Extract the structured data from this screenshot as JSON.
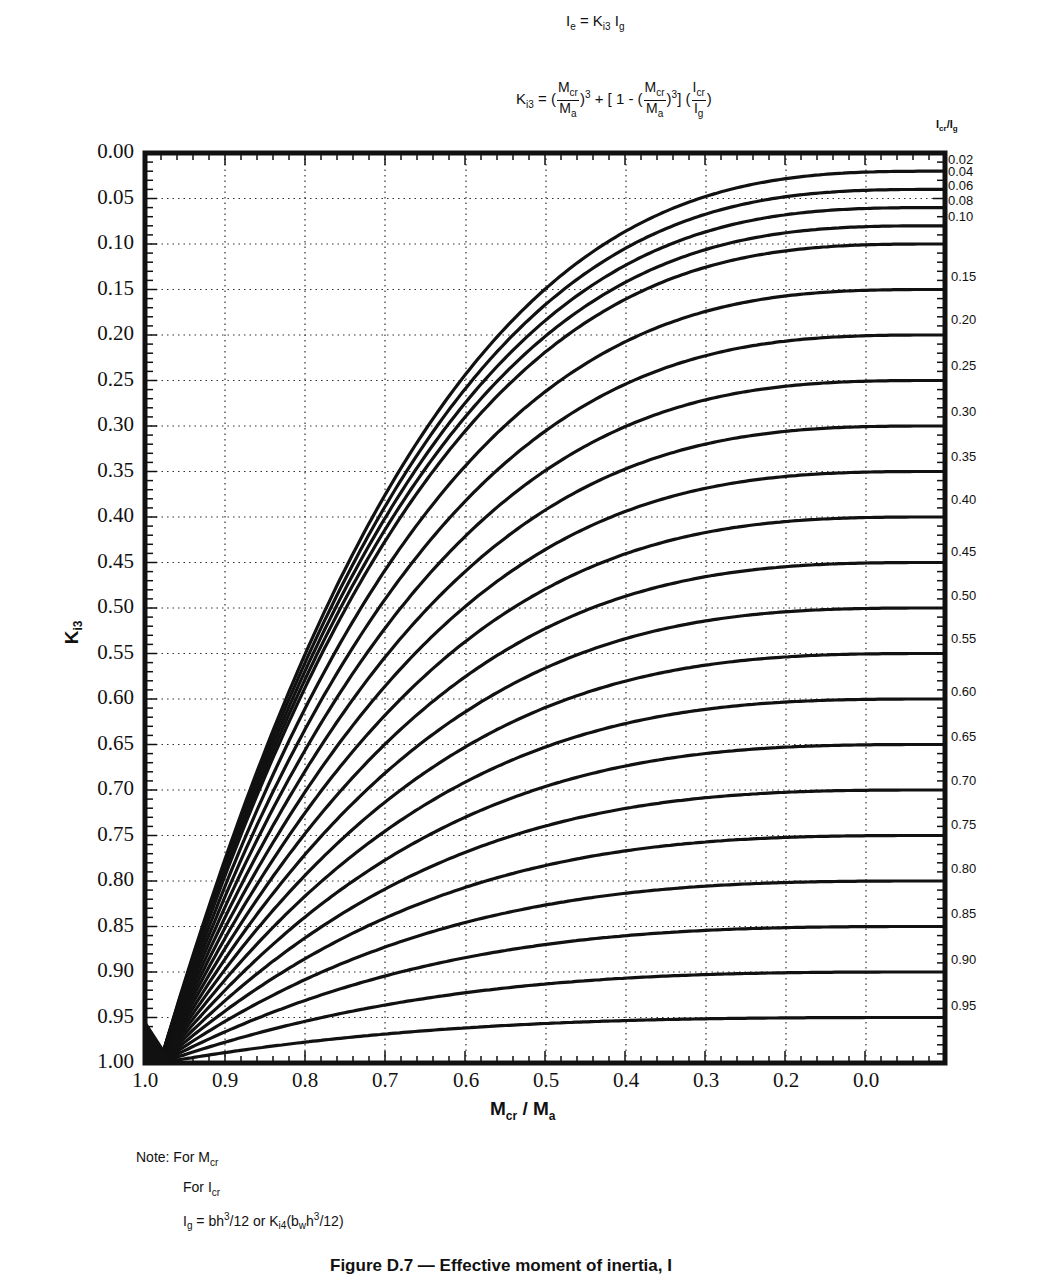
{
  "header": {
    "eq1": {
      "lhs": "I",
      "lhs_sub": "e",
      "eq": " = K",
      "k_sub": "i3",
      "rhs": " I",
      "rhs_sub": "g"
    },
    "eq2": {
      "k": "K",
      "k_sub": "i3",
      "eq": " = (",
      "frac1_num": "M",
      "frac1_num_sub": "cr",
      "frac1_den": "M",
      "frac1_den_sub": "a",
      "pow1": "3",
      "mid": " + [ 1 - (",
      "frac2_num": "M",
      "frac2_num_sub": "cr",
      "frac2_den": "M",
      "frac2_den_sub": "a",
      "pow2": "3",
      "mid2": "] (",
      "frac3_num": "I",
      "frac3_num_sub": "cr",
      "frac3_den": "I",
      "frac3_den_sub": "g",
      "close": ")"
    }
  },
  "right_axis_title": {
    "a": "I",
    "a_sub": "cr",
    "slash": "/",
    "b": "I",
    "b_sub": "g"
  },
  "y_axis_title": {
    "main": "K",
    "sub": "i3"
  },
  "x_axis_title": {
    "a": "M",
    "a_sub": "cr",
    "slash": " / ",
    "b": "M",
    "b_sub": "a"
  },
  "note": {
    "line1": "Note: For M",
    "line1_sub": "cr",
    "line2": "For I",
    "line2_sub": "cr",
    "line3_a": "I",
    "line3_a_sub": "g",
    "line3_b": " = bh",
    "line3_b_sup": "3",
    "line3_c": "/12 or K",
    "line3_c_sub": "i4",
    "line3_d": "(b",
    "line3_d_sub": "w",
    "line3_e": "h",
    "line3_e_sup": "3",
    "line3_f": "/12)"
  },
  "caption": "Figure D.7 — Effective moment of inertia, I",
  "chart_data": {
    "type": "line",
    "xlabel": "Mcr / Ma",
    "ylabel": "Ki3",
    "x_tick_labels": [
      "1.0",
      "0.9",
      "0.8",
      "0.7",
      "0.6",
      "0.5",
      "0.4",
      "0.3",
      "0.2",
      "0.0"
    ],
    "y_tick_labels": [
      "0.00",
      "0.05",
      "0.10",
      "0.15",
      "0.20",
      "0.25",
      "0.30",
      "0.35",
      "0.40",
      "0.45",
      "0.50",
      "0.55",
      "0.60",
      "0.65",
      "0.70",
      "0.75",
      "0.80",
      "0.85",
      "0.90",
      "0.95",
      "1.00"
    ],
    "ylim": [
      1.0,
      0.0
    ],
    "y_inverted": true,
    "xlim": [
      1.0,
      0.0
    ],
    "grid": "dotted",
    "legend_position": "right (curve labels Icr/Ig)",
    "series_labels": [
      "0.02",
      "0.04",
      "0.06",
      "0.08",
      "0.10",
      "0.15",
      "0.20",
      "0.25",
      "0.30",
      "0.35",
      "0.40",
      "0.45",
      "0.50",
      "0.55",
      "0.60",
      "0.65",
      "0.70",
      "0.75",
      "0.80",
      "0.85",
      "0.90",
      "0.95"
    ],
    "series_values": [
      0.02,
      0.04,
      0.06,
      0.08,
      0.1,
      0.15,
      0.2,
      0.25,
      0.3,
      0.35,
      0.4,
      0.45,
      0.5,
      0.55,
      0.6,
      0.65,
      0.7,
      0.75,
      0.8,
      0.85,
      0.9,
      0.95
    ],
    "series_label_y": [
      0.02,
      0.04,
      0.06,
      0.08,
      0.1,
      0.15,
      0.2,
      0.25,
      0.3,
      0.35,
      0.4,
      0.45,
      0.5,
      0.55,
      0.6,
      0.65,
      0.7,
      0.75,
      0.8,
      0.85,
      0.9,
      0.95
    ],
    "series": [
      {
        "name": "0.02",
        "x": [
          1.0,
          0.9,
          0.8,
          0.7,
          0.6,
          0.5,
          0.4,
          0.3,
          0.2,
          0.0
        ],
        "y": [
          1.0,
          0.734,
          0.522,
          0.356,
          0.23,
          0.142,
          0.083,
          0.046,
          0.028,
          0.02
        ]
      },
      {
        "name": "0.10",
        "x": [
          1.0,
          0.9,
          0.8,
          0.7,
          0.6,
          0.5,
          0.4,
          0.3,
          0.2,
          0.0
        ],
        "y": [
          1.0,
          0.756,
          0.561,
          0.409,
          0.294,
          0.213,
          0.158,
          0.124,
          0.107,
          0.1
        ]
      },
      {
        "name": "0.50",
        "x": [
          1.0,
          0.9,
          0.8,
          0.7,
          0.6,
          0.5,
          0.4,
          0.3,
          0.2,
          0.0
        ],
        "y": [
          1.0,
          0.865,
          0.756,
          0.672,
          0.608,
          0.563,
          0.532,
          0.514,
          0.504,
          0.5
        ]
      },
      {
        "name": "0.95",
        "x": [
          1.0,
          0.9,
          0.8,
          0.7,
          0.6,
          0.5,
          0.4,
          0.3,
          0.2,
          0.0
        ],
        "y": [
          1.0,
          0.986,
          0.976,
          0.967,
          0.961,
          0.956,
          0.953,
          0.951,
          0.95,
          0.95
        ]
      }
    ]
  },
  "colors": {
    "ink": "#111111",
    "grid": "#333333",
    "background": "#ffffff"
  }
}
